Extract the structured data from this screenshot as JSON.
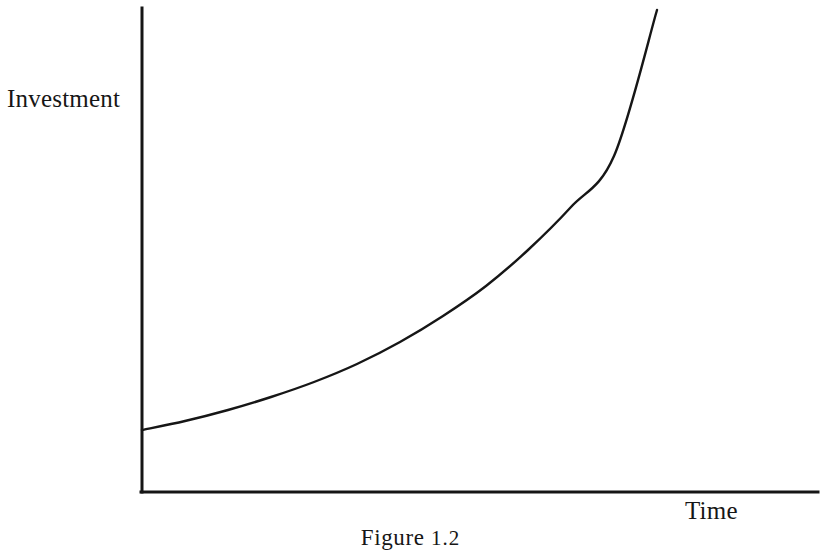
{
  "figure": {
    "caption_prefix": "Figure",
    "caption_number": "1.2",
    "background_color": "#ffffff",
    "ink_color": "#161616"
  },
  "axes": {
    "y_label": "Investment",
    "x_label": "Time",
    "y_axis_name": "vertical-axis",
    "x_axis_name": "horizontal-axis",
    "origin_x": 142,
    "origin_y": 492,
    "y_axis_top": 8,
    "x_axis_right": 818,
    "axis_stroke_width": 3
  },
  "chart_data": {
    "type": "line",
    "title": "Figure 1.2",
    "xlabel": "Time",
    "ylabel": "Investment",
    "grid": false,
    "legend": null,
    "axis_ticks": [],
    "curve_description": "exponential growth of investment over time",
    "stroke_width": 2.4,
    "xlim": [
      0,
      1
    ],
    "ylim": [
      0,
      1
    ],
    "x": [
      0.0,
      0.08,
      0.17,
      0.25,
      0.33,
      0.42,
      0.5,
      0.58,
      0.67,
      0.75,
      0.83,
      0.92,
      1.0
    ],
    "y": [
      0.128,
      0.151,
      0.179,
      0.212,
      0.251,
      0.298,
      0.354,
      0.42,
      0.498,
      0.59,
      0.7,
      0.83,
      0.985
    ],
    "points_px": [
      [
        142,
        430
      ],
      [
        185,
        421
      ],
      [
        228,
        410
      ],
      [
        271,
        397
      ],
      [
        314,
        382
      ],
      [
        357,
        364
      ],
      [
        400,
        342
      ],
      [
        443,
        316
      ],
      [
        486,
        286
      ],
      [
        528,
        250
      ],
      [
        571,
        207
      ],
      [
        614,
        156
      ],
      [
        657,
        10
      ]
    ]
  }
}
